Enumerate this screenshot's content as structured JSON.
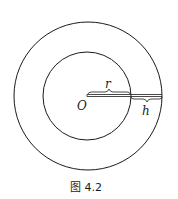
{
  "figure": {
    "caption": "图 4.2",
    "labels": {
      "center": "O",
      "inner_radius": "r",
      "ring_width": "h"
    }
  },
  "colors": {
    "stroke": "#1a1a1a",
    "background": "#ffffff"
  }
}
